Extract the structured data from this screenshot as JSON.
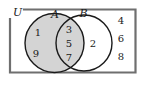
{
  "figure": {
    "type": "venn-diagram",
    "universe_label": "U",
    "set_labels": {
      "a": "A",
      "b": "B"
    },
    "regions": {
      "a_only": {
        "name": "A only",
        "shaded": true,
        "elements": [
          "1",
          "9"
        ]
      },
      "intersection": {
        "name": "A and B",
        "shaded": true,
        "elements": [
          "3",
          "5",
          "7"
        ]
      },
      "b_only": {
        "name": "B only",
        "shaded": false,
        "elements": [
          "2"
        ]
      },
      "outside": {
        "name": "Outside A and B",
        "shaded": false,
        "elements": [
          "4",
          "6",
          "8"
        ]
      }
    },
    "colors": {
      "shade_fill": "#d4d4d4",
      "unshaded_fill": "#ffffff",
      "circle_stroke": "#1a1a1a",
      "universe_stroke": "#6f6f6f",
      "text": "#1a1a1a",
      "background": "#ffffff"
    }
  }
}
